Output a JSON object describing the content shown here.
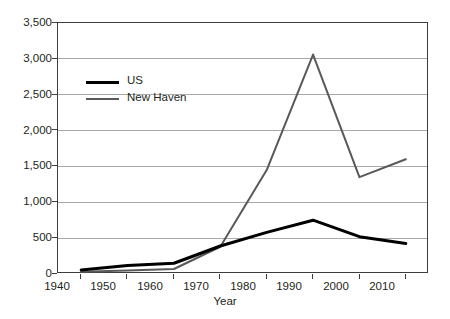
{
  "chart_data": {
    "type": "line",
    "title": "",
    "xlabel": "Year",
    "ylabel": "",
    "x": [
      1940,
      1950,
      1960,
      1970,
      1980,
      1990,
      2000,
      2010
    ],
    "xtick_labels": [
      "1940",
      "1950",
      "1960",
      "1970",
      "1980",
      "1990",
      "2000",
      "2010"
    ],
    "ytick_labels": [
      "0",
      "500",
      "1,000",
      "1,500",
      "2,000",
      "2,500",
      "3,000",
      "3,500"
    ],
    "ytick_values": [
      0,
      500,
      1000,
      1500,
      2000,
      2500,
      3000,
      3500
    ],
    "ylim": [
      0,
      3500
    ],
    "xlim": [
      1935,
      2015
    ],
    "grid": "horizontal",
    "legend_position": "upper-left-inside",
    "series": [
      {
        "name": "US",
        "color": "#000000",
        "width": 3,
        "values": [
          55,
          120,
          150,
          390,
          580,
          750,
          520,
          425
        ]
      },
      {
        "name": "New Haven",
        "color": "#595959",
        "width": 2,
        "values": [
          30,
          50,
          70,
          380,
          1450,
          3060,
          1350,
          1600
        ]
      }
    ]
  },
  "axes": {
    "frame_color": "#3d3d3d",
    "gridline_color": "#a9a9a9",
    "background": "#ffffff"
  }
}
